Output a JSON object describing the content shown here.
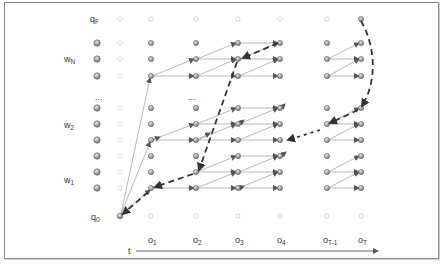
{
  "diagram": {
    "title": "",
    "row_labels": {
      "final_state": {
        "base": "q",
        "sub": "F"
      },
      "initial_state": {
        "base": "q",
        "sub": "0"
      },
      "word_N": {
        "base": "w",
        "sub": "N"
      },
      "word_2": {
        "base": "w",
        "sub": "2"
      },
      "word_1": {
        "base": "w",
        "sub": "1"
      },
      "ellipsis_left": "...",
      "ellipsis_mid": "..."
    },
    "axis": {
      "label": "t",
      "ticks": [
        {
          "base": "o",
          "sub": "1"
        },
        {
          "base": "o",
          "sub": "2"
        },
        {
          "base": "o",
          "sub": "3"
        },
        {
          "base": "o",
          "sub": "4"
        },
        {
          "base": "o",
          "sub": "T-1"
        },
        {
          "base": "o",
          "sub": "T"
        }
      ]
    },
    "colors": {
      "frame": "#8a8a8a",
      "node_fill": "#9a9a9a",
      "node_stroke": "#555555",
      "empty_node": "#cccccc",
      "edge": "#777777",
      "backtrace": "#333333"
    },
    "nodes": {
      "columns_x": [
        151,
        196,
        238,
        280,
        327,
        361
      ],
      "rows_y": {
        "wN": [
          43,
          59,
          76
        ],
        "w2": [
          108,
          124,
          140
        ],
        "w1": [
          156,
          172,
          188
        ],
        "qF": 19,
        "q0": 216
      }
    }
  }
}
